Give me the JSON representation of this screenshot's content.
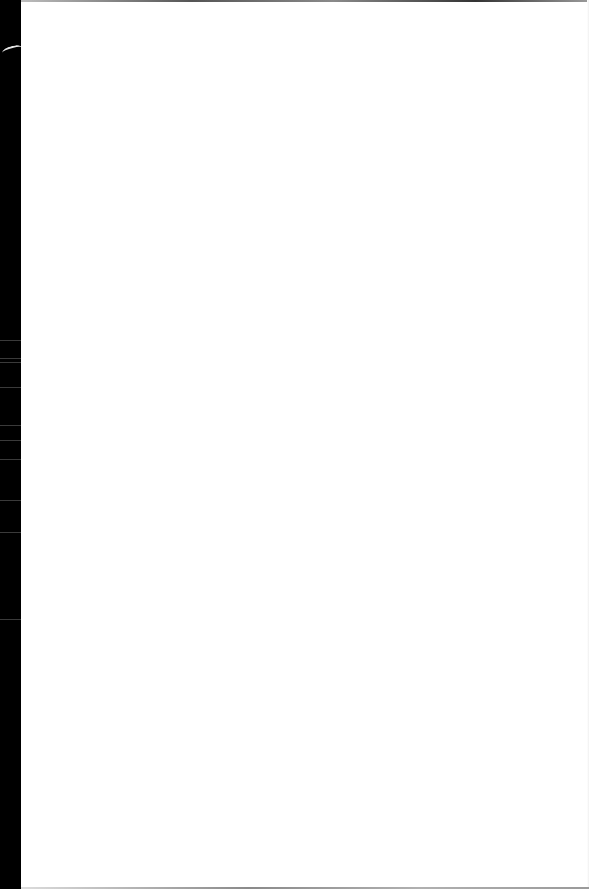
{
  "document": {
    "type": "blank-scanned-page",
    "text": "",
    "colors": {
      "page": "#ffffff",
      "scan_border": "#000000"
    }
  }
}
